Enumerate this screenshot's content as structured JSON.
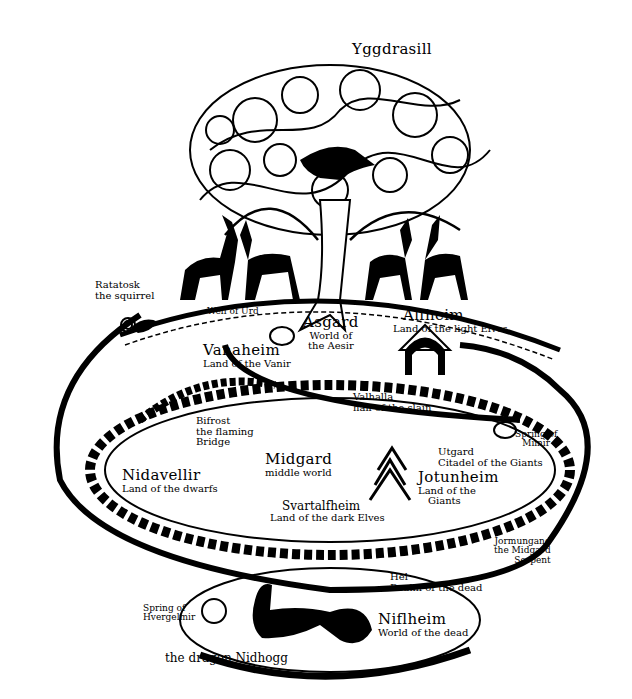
{
  "title": "Yggdrasill",
  "labels": {
    "ratatosk": {
      "name": "Ratatosk",
      "desc": "the squirrel"
    },
    "well_of_urd": "Well of Urd",
    "asgard": {
      "name": "Asgard",
      "desc1": "World of",
      "desc2": "the Aesir"
    },
    "alfheim": {
      "name": "Alfheim",
      "desc": "Land of the light Elves"
    },
    "vanaheim": {
      "name": "Vanaheim",
      "desc": "Land of the Vanir"
    },
    "valhalla": {
      "name": "Valhalla",
      "desc": "hall of the slain"
    },
    "bifrost": {
      "name": "Bifrost",
      "desc1": "the flaming",
      "desc2": "Bridge"
    },
    "spring_of_mimir": {
      "line1": "Spring of",
      "line2": "Mimir"
    },
    "utgard": {
      "name": "Utgard",
      "desc": "Citadel of the Giants"
    },
    "midgard": {
      "name": "Midgard",
      "desc": "middle world"
    },
    "jotunheim": {
      "name": "Jotunheim",
      "desc1": "Land of the",
      "desc2": "Giants"
    },
    "nidavellir": {
      "name": "Nidavellir",
      "desc": "Land of the dwarfs"
    },
    "svartalfheim": {
      "name": "Svartalfheim",
      "desc": "Land of the dark Elves"
    },
    "jormungand": {
      "line1": "Jormungand",
      "line2": "the Midgard",
      "line3": "Serpent"
    },
    "hel": {
      "name": "Hel",
      "desc": "Realm of the dead"
    },
    "spring_of_hvergelmir": {
      "line1": "Spring of",
      "line2": "Hvergelmir"
    },
    "niflheim": {
      "name": "Niflheim",
      "desc": "World of the dead"
    },
    "nidhogg": "the dragon Nidhogg"
  },
  "colors": {
    "ink": "#000000",
    "paper": "#ffffff"
  }
}
